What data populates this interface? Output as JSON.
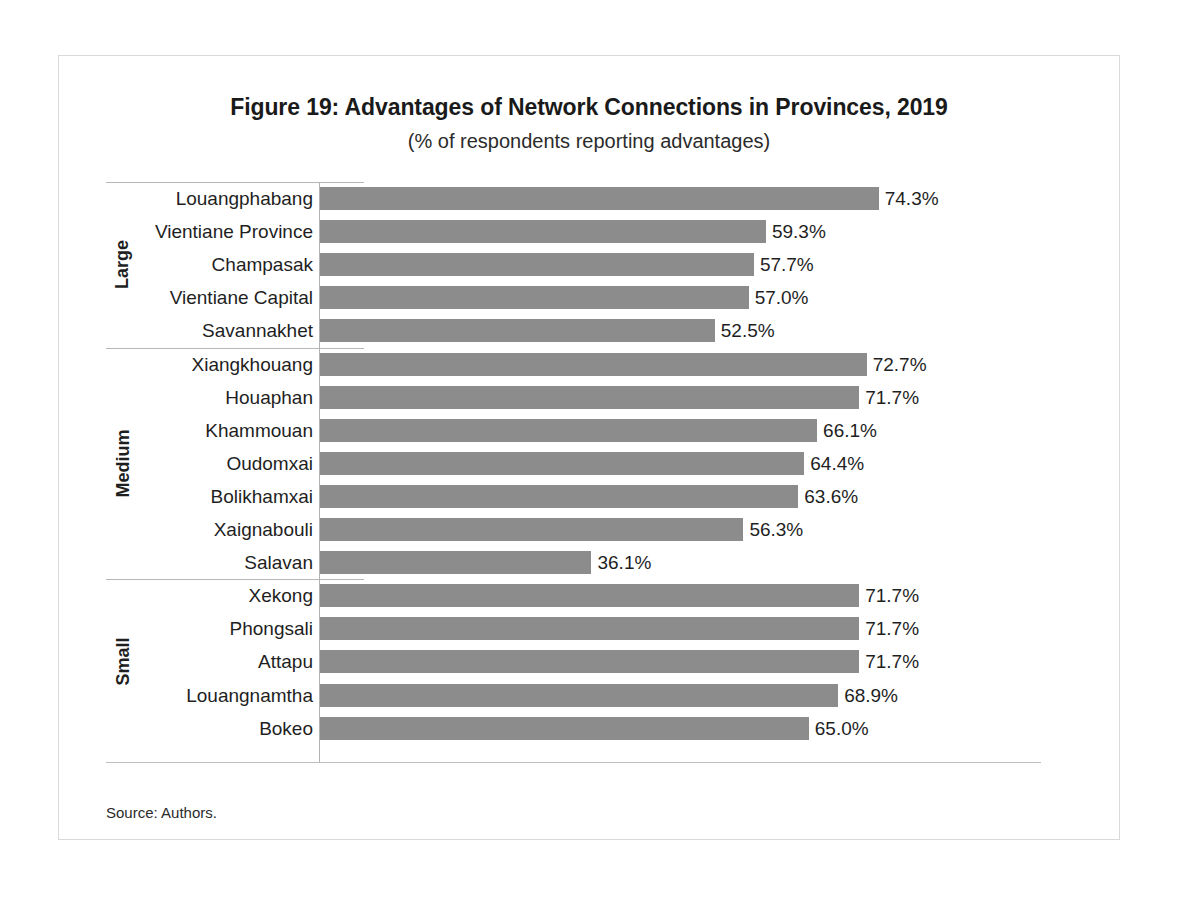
{
  "figure": {
    "title": "Figure 19: Advantages of Network Connections in Provinces, 2019",
    "subtitle": "(% of respondents reporting advantages)",
    "source": "Source: Authors."
  },
  "colors": {
    "bar": "#8c8c8c",
    "text": "#1f1f1f",
    "rule": "#b7b7b7",
    "frame": "#d9d9d9"
  },
  "chart_data": {
    "type": "bar",
    "orientation": "horizontal",
    "title": "Figure 19: Advantages of Network Connections in Provinces, 2019",
    "subtitle": "(% of respondents reporting advantages)",
    "xlabel": "",
    "ylabel": "",
    "xlim": [
      0,
      80
    ],
    "grid": false,
    "legend": false,
    "value_suffix": "%",
    "group_axis_title": "Province size group",
    "groups": [
      {
        "name": "Large",
        "categories": [
          "Louangphabang",
          "Vientiane Province",
          "Champasak",
          "Vientiane Capital",
          "Savannakhet"
        ],
        "values": [
          74.3,
          59.3,
          57.7,
          57.0,
          52.5
        ],
        "labels": [
          "74.3%",
          "59.3%",
          "57.7%",
          "57.0%",
          "52.5%"
        ]
      },
      {
        "name": "Medium",
        "categories": [
          "Xiangkhouang",
          "Houaphan",
          "Khammouan",
          "Oudomxai",
          "Bolikhamxai",
          "Xaignabouli",
          "Salavan"
        ],
        "values": [
          72.7,
          71.7,
          66.1,
          64.4,
          63.6,
          56.3,
          36.1
        ],
        "labels": [
          "72.7%",
          "71.7%",
          "66.1%",
          "64.4%",
          "63.6%",
          "56.3%",
          "36.1%"
        ]
      },
      {
        "name": "Small",
        "categories": [
          "Xekong",
          "Phongsali",
          "Attapu",
          "Louangnamtha",
          "Bokeo"
        ],
        "values": [
          71.7,
          71.7,
          71.7,
          68.9,
          65.0
        ],
        "labels": [
          "71.7%",
          "71.7%",
          "71.7%",
          "68.9%",
          "65.0%"
        ]
      }
    ]
  }
}
